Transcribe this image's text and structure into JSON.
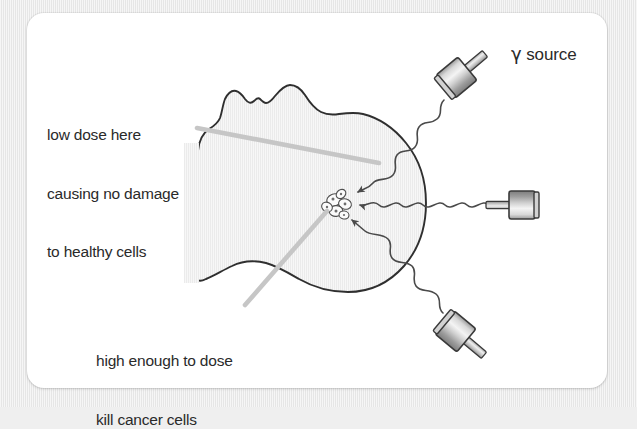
{
  "figure": {
    "title_visible": false,
    "background_color": "#ececec",
    "card_color": "#ffffff",
    "ink_color": "#2a2a2a",
    "leader_line_color": "#c6c6c6",
    "head_fill_color": "#f2f2f2"
  },
  "annotations": {
    "low_dose": {
      "line1": "low dose here",
      "line2": "causing no damage",
      "line3": "to healthy cells"
    },
    "high_dose": {
      "line1": "high enough to dose",
      "line2": "kill cancer cells"
    }
  },
  "labels": {
    "gamma_source_symbol": "γ",
    "gamma_source_text": " source"
  },
  "diagram": {
    "target": "cancer-cell-cluster",
    "sources": [
      {
        "name": "gamma-source-top",
        "orientation": "diagonal-down-left"
      },
      {
        "name": "gamma-source-right",
        "orientation": "horizontal-left"
      },
      {
        "name": "gamma-source-bottom",
        "orientation": "diagonal-up-left"
      }
    ],
    "beams": [
      {
        "name": "beam-top",
        "style": "wavy",
        "arrow": true
      },
      {
        "name": "beam-right",
        "style": "wavy",
        "arrow": true
      },
      {
        "name": "beam-bottom",
        "style": "wavy",
        "arrow": true
      }
    ]
  }
}
